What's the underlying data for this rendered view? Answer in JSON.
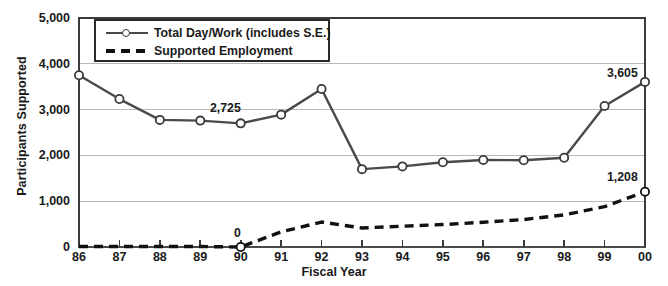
{
  "chart_data": {
    "type": "line",
    "title": "",
    "xlabel": "Fiscal Year",
    "ylabel": "Participants Supported",
    "categories": [
      "86",
      "87",
      "88",
      "89",
      "90",
      "91",
      "92",
      "93",
      "94",
      "95",
      "96",
      "97",
      "98",
      "99",
      "00"
    ],
    "ylim": [
      0,
      5000
    ],
    "yticks": [
      "0",
      "1,000",
      "2,000",
      "3,000",
      "4,000",
      "5,000"
    ],
    "ytick_values": [
      0,
      1000,
      2000,
      3000,
      4000,
      5000
    ],
    "grid": "horizontal",
    "legend_position": "top-left inside plot",
    "series": [
      {
        "name": "Total Day/Work (includes S.E.)",
        "style": "solid-with-open-circle-markers",
        "values": [
          3750,
          3230,
          2775,
          2760,
          2700,
          2890,
          3450,
          1700,
          1760,
          1850,
          1900,
          1895,
          1950,
          3080,
          3605
        ]
      },
      {
        "name": "Supported Employment",
        "style": "dashed",
        "values": [
          10,
          10,
          10,
          10,
          0,
          330,
          545,
          415,
          455,
          490,
          540,
          600,
          700,
          880,
          1208
        ]
      }
    ],
    "annotations": [
      {
        "text": "2,725",
        "series": "Total Day/Work (includes S.E.)",
        "near_category": "90"
      },
      {
        "text": "3,605",
        "series": "Total Day/Work (includes S.E.)",
        "near_category": "00"
      },
      {
        "text": "0",
        "series": "Supported Employment",
        "near_category": "90"
      },
      {
        "text": "1,208",
        "series": "Supported Employment",
        "near_category": "00"
      }
    ]
  },
  "legend": {
    "items": [
      {
        "label": "Total Day/Work (includes S.E.)"
      },
      {
        "label": "Supported Employment"
      }
    ]
  },
  "colors": {
    "solid_line": "#4a4a4a",
    "dashed_line": "#111111",
    "gridline": "#b9b9b9",
    "axis": "#3a3a3a",
    "background": "#ffffff"
  }
}
